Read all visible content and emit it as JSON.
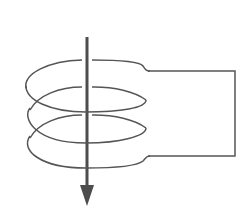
{
  "diagram": {
    "title": "Coil (solenoid) with magnetic field arrow",
    "colors": {
      "background": "#ffffff",
      "wire": "#555555",
      "arrow": "#4d4d4d"
    },
    "elements": {
      "coil": {
        "turns": 3,
        "center_x": 86,
        "radius_x": 60,
        "radius_y": 26,
        "turn_centers_y": [
          86,
          115,
          141
        ]
      },
      "circuit_wire": {
        "top_y": 71,
        "bottom_y": 156,
        "left_x": 147,
        "right_x": 235
      },
      "arrow": {
        "x": 87,
        "y_start": 37,
        "y_end": 206,
        "direction": "down"
      }
    }
  }
}
